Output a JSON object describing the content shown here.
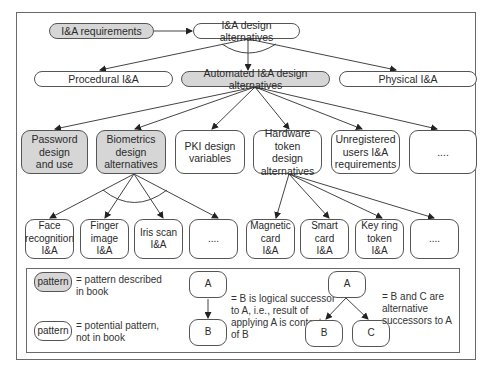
{
  "diagram": {
    "row1": {
      "requirements": "I&A requirements",
      "design_alternatives": "I&A  design alternatives"
    },
    "row2": {
      "procedural": "Procedural I&A",
      "automated": "Automated I&A design alternatives",
      "physical": "Physical I&A"
    },
    "row3": {
      "password": "Password\ndesign\nand use",
      "biometrics": "Biometrics\ndesign\nalternatives",
      "pki": "PKI design\nvariables",
      "hardware_token": "Hardware token\ndesign\nalternatives",
      "unregistered": "Unregistered\nusers I&A\nrequirements",
      "more": "...."
    },
    "row4": {
      "face": "Face\nrecognition\nI&A",
      "finger": "Finger\nimage\nI&A",
      "iris": "Iris scan\nI&A",
      "bio_more": "....",
      "magnetic": "Magnetic\ncard\nI&A",
      "smart": "Smart card\nI&A",
      "keyring": "Key ring\ntoken\nI&A",
      "hw_more": "...."
    }
  },
  "legend": {
    "shaded_label": "pattern",
    "shaded_desc": "= pattern described\n   in book",
    "plain_label": "pattern",
    "plain_desc": "= potential pattern,\n   not in book",
    "seq_a": "A",
    "seq_b": "B",
    "seq_desc": "= B is logical successor\n   to A, i.e., result of\n   applying A is context\n   of B",
    "alt_a": "A",
    "alt_b": "B",
    "alt_c": "C",
    "alt_desc": "= B and C are\n   alternative\n   successors to A"
  },
  "colors": {
    "shaded_fill": "#d6d6d6",
    "line": "#444444"
  }
}
